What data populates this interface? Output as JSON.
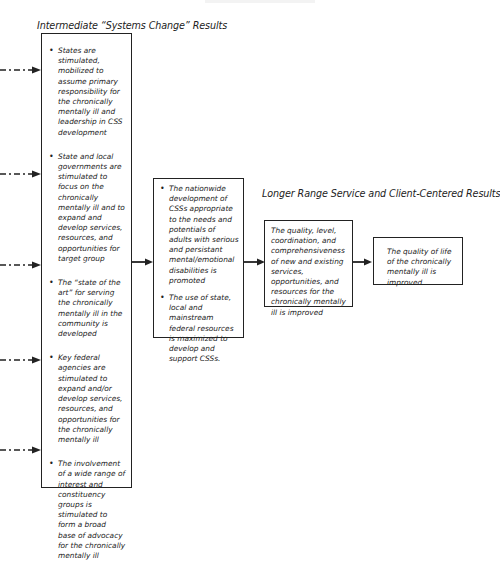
{
  "diagram": {
    "top_fragment": "",
    "intermediate": {
      "heading": "Intermediate “Systems Change” Results",
      "items": [
        "States are stimulated, mobilized to assume primary responsibility for the chronically mentally ill and leadership in CSS development",
        "State and local governments are stimulated to focus on the chronically mentally ill and to expand and develop services, resources, and opportunities for target group",
        "The “state of the art” for serving the chronically mentally ill in the community is developed",
        "Key federal agencies are stimulated to expand and/or develop services, resources, and opportunities for the chronically mentally ill",
        "The involvement of a wide range of interest and constituency groups is stimulated to form a broad base of advocacy for the chronically mentally ill"
      ]
    },
    "middle": {
      "items": [
        "The nationwide development of CSSs appropriate to the needs and potentials of adults with serious and persistant mental/emotional disabilities is promoted",
        "The use of state, local and mainstream federal resources is maximized to develop and support CSSs."
      ]
    },
    "longer_range": {
      "heading": "Longer Range Service and Client-Centered Results",
      "box1": "The quality, level, coordination, and comprehensiveness of new and existing services, opportunities, and resources for the chronically mentally ill is improved",
      "box2": "The quality of life of the chronically mentally ill is improved"
    },
    "colors": {
      "line": "#222222",
      "background": "#ffffff",
      "text": "#222222"
    }
  }
}
